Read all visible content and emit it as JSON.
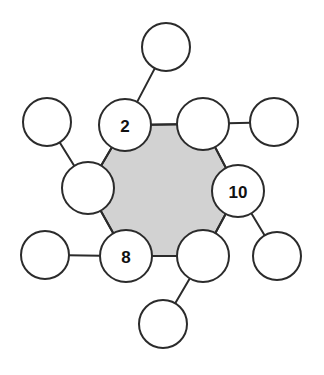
{
  "diagram": {
    "type": "hexagonal-node-graph",
    "canvas": {
      "width": 324,
      "height": 375,
      "background": "#ffffff"
    },
    "colors": {
      "hexagon_fill": "#d2d2d2",
      "hexagon_stroke": "#2b2b2b",
      "node_fill": "#ffffff",
      "node_stroke": "#2b2b2b",
      "edge_stroke": "#2b2b2b",
      "label_color": "#111111"
    },
    "hexagon": {
      "name": "shaded-hexagon",
      "points": "125,125 203,124 238,191 203,256 126,256 88,188"
    },
    "ring_nodes": [
      {
        "id": "ring-top-left",
        "label": "2",
        "cx": 125,
        "cy": 125,
        "r": 26
      },
      {
        "id": "ring-top-right",
        "label": "",
        "cx": 203,
        "cy": 124,
        "r": 26
      },
      {
        "id": "ring-right",
        "label": "10",
        "cx": 238,
        "cy": 191,
        "r": 26
      },
      {
        "id": "ring-bottom-right",
        "label": "",
        "cx": 203,
        "cy": 256,
        "r": 26
      },
      {
        "id": "ring-bottom-left",
        "label": "8",
        "cx": 126,
        "cy": 256,
        "r": 26
      },
      {
        "id": "ring-left",
        "label": "",
        "cx": 88,
        "cy": 188,
        "r": 26
      }
    ],
    "satellite_nodes": [
      {
        "id": "satellite-top",
        "label": "",
        "cx": 166,
        "cy": 47,
        "r": 24,
        "parent": "ring-top-left"
      },
      {
        "id": "satellite-upper-left",
        "label": "",
        "cx": 47,
        "cy": 122,
        "r": 24,
        "parent": "ring-left"
      },
      {
        "id": "satellite-upper-right",
        "label": "",
        "cx": 274,
        "cy": 122,
        "r": 24,
        "parent": "ring-top-right"
      },
      {
        "id": "satellite-lower-left",
        "label": "",
        "cx": 45,
        "cy": 255,
        "r": 24,
        "parent": "ring-bottom-left"
      },
      {
        "id": "satellite-lower-right",
        "label": "",
        "cx": 277,
        "cy": 256,
        "r": 24,
        "parent": "ring-right"
      },
      {
        "id": "satellite-bottom",
        "label": "",
        "cx": 163,
        "cy": 324,
        "r": 24,
        "parent": "ring-bottom-right"
      }
    ],
    "ring_edges": [
      {
        "from": "ring-top-left",
        "to": "ring-top-right"
      },
      {
        "from": "ring-top-right",
        "to": "ring-right"
      },
      {
        "from": "ring-right",
        "to": "ring-bottom-right"
      },
      {
        "from": "ring-bottom-right",
        "to": "ring-bottom-left"
      },
      {
        "from": "ring-bottom-left",
        "to": "ring-left"
      },
      {
        "from": "ring-left",
        "to": "ring-top-left"
      }
    ],
    "spoke_edges": [
      {
        "from": "ring-top-left",
        "to": "satellite-top"
      },
      {
        "from": "ring-left",
        "to": "satellite-upper-left"
      },
      {
        "from": "ring-top-right",
        "to": "satellite-upper-right"
      },
      {
        "from": "ring-bottom-left",
        "to": "satellite-lower-left"
      },
      {
        "from": "ring-right",
        "to": "satellite-lower-right"
      },
      {
        "from": "ring-bottom-right",
        "to": "satellite-bottom"
      }
    ]
  },
  "chart_data": {
    "type": "diagram",
    "title": "",
    "labels_present": [
      "2",
      "10",
      "8"
    ],
    "ring_node_count": 6,
    "satellite_node_count": 6,
    "labeled_node_count": 3,
    "empty_node_count": 9
  }
}
